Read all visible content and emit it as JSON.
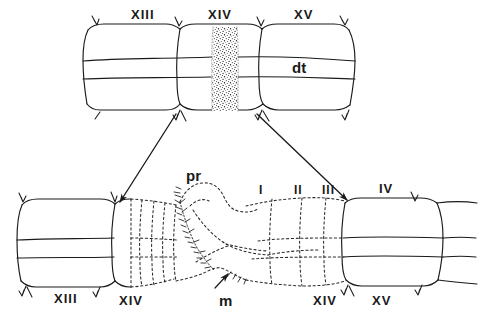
{
  "figure": {
    "background_color": "#ffffff",
    "ink_color": "#1a1a1a"
  },
  "upper_panel": {
    "name": "upper-specimen",
    "segment_labels": [
      {
        "id": "u-xiii",
        "text": "XIII",
        "x": 131,
        "y": 8
      },
      {
        "id": "u-xiv",
        "text": "XIV",
        "x": 208,
        "y": 8
      },
      {
        "id": "u-xv",
        "text": "XV",
        "x": 294,
        "y": 8
      }
    ],
    "interior_labels": [
      {
        "id": "u-dt",
        "text": "dt",
        "x": 292,
        "y": 60
      }
    ],
    "stipple_band": {
      "name": "stippled-band",
      "x": 213,
      "y": 27,
      "width": 24,
      "height": 84
    }
  },
  "lower_panel": {
    "name": "lower-specimen",
    "top_labels": [
      {
        "id": "l-pr",
        "text": "pr",
        "x": 186,
        "y": 168,
        "style": "italic-lbl"
      },
      {
        "id": "l-i",
        "text": "I",
        "x": 259,
        "y": 184,
        "style": "roman-sm"
      },
      {
        "id": "l-ii",
        "text": "II",
        "x": 294,
        "y": 184,
        "style": "roman-sm"
      },
      {
        "id": "l-iii",
        "text": "III",
        "x": 322,
        "y": 184,
        "style": "roman-sm"
      },
      {
        "id": "l-iv",
        "text": "IV",
        "x": 379,
        "y": 182,
        "style": "roman"
      }
    ],
    "bottom_labels": [
      {
        "id": "b-xiii",
        "text": "XIII",
        "x": 54,
        "y": 292,
        "style": "roman"
      },
      {
        "id": "b-xiv",
        "text": "XIV",
        "x": 119,
        "y": 294,
        "style": "roman"
      },
      {
        "id": "b-m",
        "text": "m",
        "x": 219,
        "y": 293,
        "style": "italic-lbl"
      },
      {
        "id": "b-xiv2",
        "text": "XIV",
        "x": 313,
        "y": 294,
        "style": "roman"
      },
      {
        "id": "b-xv",
        "text": "XV",
        "x": 372,
        "y": 294,
        "style": "roman"
      }
    ]
  },
  "connectors": [
    {
      "id": "arrow-left",
      "name": "connector-arrow-left",
      "from_x": 176,
      "from_y": 113,
      "to_x": 120,
      "to_y": 203
    },
    {
      "id": "arrow-right",
      "name": "connector-arrow-right",
      "from_x": 257,
      "from_y": 113,
      "to_x": 348,
      "to_y": 201
    }
  ]
}
